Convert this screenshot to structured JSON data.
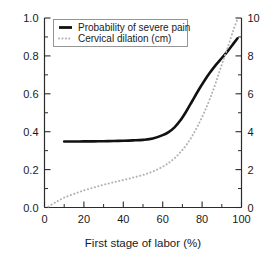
{
  "chart_data": {
    "type": "line",
    "title": "",
    "xlabel": "First stage of labor (%)",
    "ylabel": "",
    "ylabel_right": "",
    "xlim": [
      0,
      100
    ],
    "ylim": [
      0.0,
      1.0
    ],
    "ylim_right": [
      0,
      10
    ],
    "grid": false,
    "legend_position": "top-left",
    "x_ticks": [
      0,
      20,
      40,
      60,
      80,
      100
    ],
    "x_ticks_labels": [
      "0",
      "20",
      "40",
      "60",
      "80",
      "100"
    ],
    "x_minor_ticks": [
      10,
      30,
      50,
      70,
      90
    ],
    "y_ticks": [
      0.0,
      0.2,
      0.4,
      0.6,
      0.8,
      1.0
    ],
    "y_ticks_labels": [
      "0.0",
      "0.2",
      "0.4",
      "0.6",
      "0.8",
      "1.0"
    ],
    "y_minor_ticks": [
      0.1,
      0.3,
      0.5,
      0.7,
      0.9
    ],
    "y_right_ticks": [
      0,
      2,
      4,
      6,
      8,
      10
    ],
    "y_right_ticks_labels": [
      "0",
      "2",
      "4",
      "6",
      "8",
      "10"
    ],
    "y_right_minor_ticks": [
      1,
      3,
      5,
      7,
      9
    ],
    "series": [
      {
        "name": "Probability of severe pain",
        "axis": "left",
        "style": "solid",
        "color": "#111111",
        "x": [
          10,
          15,
          20,
          25,
          30,
          35,
          40,
          45,
          50,
          55,
          60,
          63,
          66,
          69,
          72,
          75,
          78,
          81,
          84,
          87,
          90,
          93,
          96,
          98
        ],
        "y": [
          0.348,
          0.348,
          0.349,
          0.349,
          0.35,
          0.351,
          0.352,
          0.354,
          0.357,
          0.364,
          0.382,
          0.398,
          0.423,
          0.46,
          0.508,
          0.562,
          0.616,
          0.666,
          0.712,
          0.753,
          0.789,
          0.825,
          0.866,
          0.893
        ]
      },
      {
        "name": "Cervical dilation (cm)",
        "axis": "right",
        "style": "dotted",
        "color": "#b3b3b3",
        "x": [
          2,
          6,
          10,
          15,
          20,
          25,
          30,
          35,
          40,
          45,
          50,
          55,
          60,
          63,
          66,
          69,
          72,
          75,
          78,
          81,
          84,
          87,
          90,
          93,
          96,
          98
        ],
        "y": [
          0.05,
          0.3,
          0.52,
          0.72,
          0.9,
          1.05,
          1.2,
          1.33,
          1.45,
          1.58,
          1.72,
          1.9,
          2.15,
          2.35,
          2.6,
          2.92,
          3.3,
          3.78,
          4.35,
          5.0,
          5.75,
          6.6,
          7.55,
          8.45,
          9.4,
          9.95
        ]
      }
    ],
    "legend": [
      {
        "label": "Probability of severe pain",
        "style": "solid"
      },
      {
        "label": "Cervical dilation (cm)",
        "style": "dotted"
      }
    ]
  }
}
